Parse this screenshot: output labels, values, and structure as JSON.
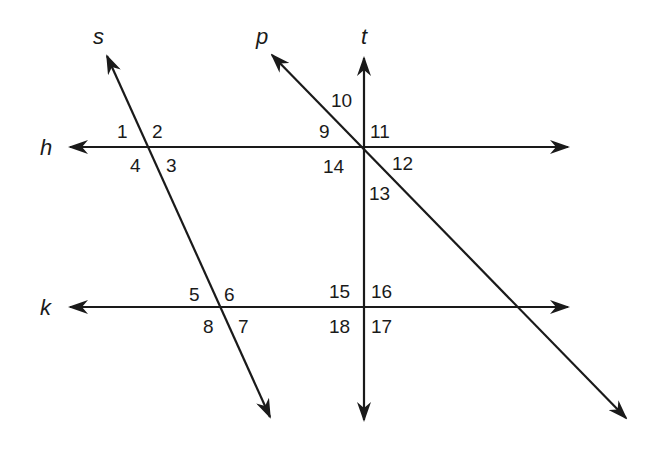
{
  "diagram": {
    "title": "",
    "lines": [
      {
        "name": "h",
        "from": [
          70,
          147
        ],
        "to": [
          568,
          147
        ],
        "arrows": "both",
        "label_pos": [
          40,
          155
        ]
      },
      {
        "name": "k",
        "from": [
          70,
          307
        ],
        "to": [
          568,
          307
        ],
        "arrows": "both",
        "label_pos": [
          40,
          315
        ]
      },
      {
        "name": "s",
        "from": [
          107,
          56
        ],
        "to": [
          270,
          417
        ],
        "arrows": "both",
        "label_pos": [
          93,
          44
        ]
      },
      {
        "name": "t",
        "from": [
          364,
          58
        ],
        "to": [
          364,
          420
        ],
        "arrows": "both",
        "label_pos": [
          361,
          44
        ]
      },
      {
        "name": "p",
        "from": [
          272,
          55
        ],
        "to": [
          626,
          418
        ],
        "arrows": "both",
        "label_pos": [
          256,
          44
        ]
      }
    ],
    "angle_labels": [
      {
        "text": "1",
        "x": 117,
        "y": 138
      },
      {
        "text": "2",
        "x": 152,
        "y": 138
      },
      {
        "text": "3",
        "x": 166,
        "y": 172
      },
      {
        "text": "4",
        "x": 130,
        "y": 172
      },
      {
        "text": "5",
        "x": 189,
        "y": 301
      },
      {
        "text": "6",
        "x": 224,
        "y": 301
      },
      {
        "text": "7",
        "x": 238,
        "y": 333
      },
      {
        "text": "8",
        "x": 203,
        "y": 333
      },
      {
        "text": "9",
        "x": 319,
        "y": 138
      },
      {
        "text": "10",
        "x": 331,
        "y": 107
      },
      {
        "text": "11",
        "x": 370,
        "y": 138
      },
      {
        "text": "12",
        "x": 392,
        "y": 170
      },
      {
        "text": "13",
        "x": 369,
        "y": 200
      },
      {
        "text": "14",
        "x": 323,
        "y": 173
      },
      {
        "text": "15",
        "x": 329,
        "y": 298
      },
      {
        "text": "16",
        "x": 371,
        "y": 298
      },
      {
        "text": "17",
        "x": 371,
        "y": 333
      },
      {
        "text": "18",
        "x": 329,
        "y": 333
      }
    ]
  }
}
